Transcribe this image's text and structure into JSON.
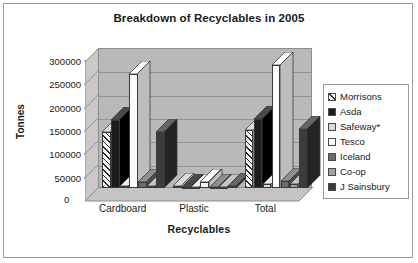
{
  "chart_data": {
    "type": "bar",
    "title": "Breakdown of Recyclables in 2005",
    "xlabel": "Recyclables",
    "ylabel": "Tonnes",
    "categories": [
      "Cardboard",
      "Plastic",
      "Total"
    ],
    "ylim": [
      0,
      300000
    ],
    "ytick_labels": [
      "300000",
      "250000",
      "200000",
      "150000",
      "100000",
      "50000",
      "0"
    ],
    "ytick_values": [
      300000,
      250000,
      200000,
      150000,
      100000,
      50000,
      0
    ],
    "ytick_step": 50000,
    "grid": true,
    "legend_position": "right",
    "style": "3d-column-cluster",
    "series": [
      {
        "name": "Morrisons",
        "values": [
          120000,
          5000,
          125000
        ],
        "color": "#f2f2f2",
        "pattern": "diagonal-hatch"
      },
      {
        "name": "Asda",
        "values": [
          145000,
          3000,
          148000
        ],
        "color": "#1c1c1c",
        "pattern": "solid"
      },
      {
        "name": "Safeway*",
        "values": [
          5000,
          3000,
          8000
        ],
        "color": "#d9d9d9",
        "pattern": "solid"
      },
      {
        "name": "Tesco",
        "values": [
          245000,
          13000,
          263000
        ],
        "color": "#fbfbfb",
        "pattern": "solid"
      },
      {
        "name": "Iceland",
        "values": [
          12000,
          3000,
          15000
        ],
        "color": "#6b6b6b",
        "pattern": "solid"
      },
      {
        "name": "Co-op",
        "values": [
          5000,
          3000,
          8000
        ],
        "color": "#a3a3a3",
        "pattern": "solid"
      },
      {
        "name": "J Sainsbury",
        "values": [
          120000,
          5000,
          127000
        ],
        "color": "#3c3c3c",
        "pattern": "solid"
      }
    ]
  },
  "legend": {
    "items": [
      {
        "label": "Morrisons"
      },
      {
        "label": "Asda"
      },
      {
        "label": "Safeway*"
      },
      {
        "label": "Tesco"
      },
      {
        "label": "Iceland"
      },
      {
        "label": "Co-op"
      },
      {
        "label": "J Sainsbury"
      }
    ]
  }
}
